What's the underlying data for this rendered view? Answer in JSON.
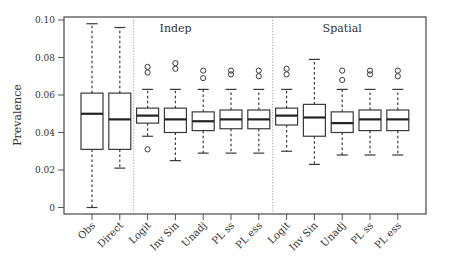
{
  "chart_data": {
    "type": "box",
    "title": "",
    "xlabel": "",
    "ylabel": "Prevalence",
    "ylim": [
      0,
      0.1
    ],
    "yticks": [
      0,
      0.02,
      0.04,
      0.06,
      0.08,
      0.1
    ],
    "ytick_labels": [
      "0",
      "0.02",
      "0.04",
      "0.06",
      "0.08",
      "0.10"
    ],
    "grid": false,
    "legend": null,
    "panels": [
      {
        "label": "",
        "categories": [
          "Obs",
          "Direct"
        ]
      },
      {
        "label": "Indep",
        "categories": [
          "Logit",
          "Inv Sin",
          "Unadj",
          "PL ss",
          "PL ess"
        ]
      },
      {
        "label": "Spatial",
        "categories": [
          "Logit",
          "Inv Sin",
          "Unadj",
          "PL ss",
          "PL ess"
        ]
      }
    ],
    "categories": [
      "Obs",
      "Direct",
      "Logit",
      "Inv Sin",
      "Unadj",
      "PL ss",
      "PL ess",
      "Logit",
      "Inv Sin",
      "Unadj",
      "PL ss",
      "PL ess"
    ],
    "boxes": [
      {
        "group": "",
        "name": "Obs",
        "whisker_low": 0.0,
        "q1": 0.031,
        "median": 0.05,
        "q3": 0.061,
        "whisker_high": 0.098,
        "outliers": []
      },
      {
        "group": "",
        "name": "Direct",
        "whisker_low": 0.021,
        "q1": 0.031,
        "median": 0.047,
        "q3": 0.061,
        "whisker_high": 0.096,
        "outliers": []
      },
      {
        "group": "Indep",
        "name": "Logit",
        "whisker_low": 0.038,
        "q1": 0.045,
        "median": 0.049,
        "q3": 0.053,
        "whisker_high": 0.063,
        "outliers": [
          0.031,
          0.072,
          0.075
        ]
      },
      {
        "group": "Indep",
        "name": "Inv Sin",
        "whisker_low": 0.025,
        "q1": 0.04,
        "median": 0.047,
        "q3": 0.053,
        "whisker_high": 0.063,
        "outliers": [
          0.074,
          0.077
        ]
      },
      {
        "group": "Indep",
        "name": "Unadj",
        "whisker_low": 0.029,
        "q1": 0.041,
        "median": 0.046,
        "q3": 0.051,
        "whisker_high": 0.063,
        "outliers": [
          0.069,
          0.073
        ]
      },
      {
        "group": "Indep",
        "name": "PL ss",
        "whisker_low": 0.029,
        "q1": 0.042,
        "median": 0.047,
        "q3": 0.052,
        "whisker_high": 0.063,
        "outliers": [
          0.071,
          0.073
        ]
      },
      {
        "group": "Indep",
        "name": "PL ess",
        "whisker_low": 0.029,
        "q1": 0.042,
        "median": 0.047,
        "q3": 0.052,
        "whisker_high": 0.063,
        "outliers": [
          0.07,
          0.073
        ]
      },
      {
        "group": "Spatial",
        "name": "Logit",
        "whisker_low": 0.03,
        "q1": 0.044,
        "median": 0.049,
        "q3": 0.053,
        "whisker_high": 0.063,
        "outliers": [
          0.071,
          0.074
        ]
      },
      {
        "group": "Spatial",
        "name": "Inv Sin",
        "whisker_low": 0.023,
        "q1": 0.038,
        "median": 0.048,
        "q3": 0.055,
        "whisker_high": 0.079,
        "outliers": []
      },
      {
        "group": "Spatial",
        "name": "Unadj",
        "whisker_low": 0.028,
        "q1": 0.04,
        "median": 0.045,
        "q3": 0.051,
        "whisker_high": 0.063,
        "outliers": [
          0.068,
          0.073
        ]
      },
      {
        "group": "Spatial",
        "name": "PL ss",
        "whisker_low": 0.028,
        "q1": 0.041,
        "median": 0.047,
        "q3": 0.052,
        "whisker_high": 0.063,
        "outliers": [
          0.071,
          0.073
        ]
      },
      {
        "group": "Spatial",
        "name": "PL ess",
        "whisker_low": 0.028,
        "q1": 0.041,
        "median": 0.047,
        "q3": 0.052,
        "whisker_high": 0.063,
        "outliers": [
          0.07,
          0.073
        ]
      }
    ],
    "colors": {
      "stroke": "#3a3a3a",
      "frame": "#555555",
      "divider": "#888888",
      "background": "#ffffff"
    }
  }
}
